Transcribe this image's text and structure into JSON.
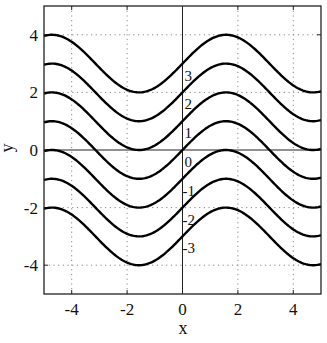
{
  "chart_data": {
    "type": "line",
    "title": "",
    "xlabel": "x",
    "ylabel": "y",
    "xlim": [
      -5,
      5
    ],
    "ylim": [
      -5,
      5
    ],
    "xticks": [
      -4,
      -2,
      0,
      2,
      4
    ],
    "yticks": [
      -4,
      -2,
      0,
      2,
      4
    ],
    "grid": true,
    "grid_style": "dotted",
    "zero_lines": true,
    "legend": null,
    "function": "y = sin(x) + C",
    "series": [
      {
        "name": "3",
        "C": 3
      },
      {
        "name": "2",
        "C": 2
      },
      {
        "name": "1",
        "C": 1
      },
      {
        "name": "0",
        "C": 0
      },
      {
        "name": "-1",
        "C": -1
      },
      {
        "name": "-2",
        "C": -2
      },
      {
        "name": "-3",
        "C": -3
      }
    ],
    "annotations": [
      "3",
      "2",
      "1",
      "0",
      "-1",
      "-2",
      "-3"
    ],
    "colors": {
      "curve": "#000000",
      "axes": "#222222",
      "grid": "#888888"
    }
  }
}
